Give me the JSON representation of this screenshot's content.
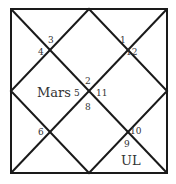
{
  "chart_type": "North Indian Kundli",
  "colors": {
    "line": "#1a1a1a",
    "text": "#333333",
    "background": "#ffffff"
  },
  "house_signs": [
    {
      "sign": "1",
      "x": 120,
      "y": 43
    },
    {
      "sign": "12",
      "x": 126,
      "y": 54
    },
    {
      "sign": "3",
      "x": 48,
      "y": 43
    },
    {
      "sign": "4",
      "x": 38,
      "y": 53
    },
    {
      "sign": "2",
      "x": 86,
      "y": 83
    },
    {
      "sign": "5",
      "x": 75,
      "y": 97
    },
    {
      "sign": "11",
      "x": 96,
      "y": 97
    },
    {
      "sign": "8",
      "x": 86,
      "y": 110
    },
    {
      "sign": "6",
      "x": 38,
      "y": 134
    },
    {
      "sign": "10",
      "x": 128,
      "y": 134
    },
    {
      "sign": "9",
      "x": 122,
      "y": 147
    }
  ],
  "planets": [
    {
      "name": "Mars",
      "x": 35,
      "y": 97
    },
    {
      "name": "UL",
      "x": 121,
      "y": 165
    }
  ]
}
